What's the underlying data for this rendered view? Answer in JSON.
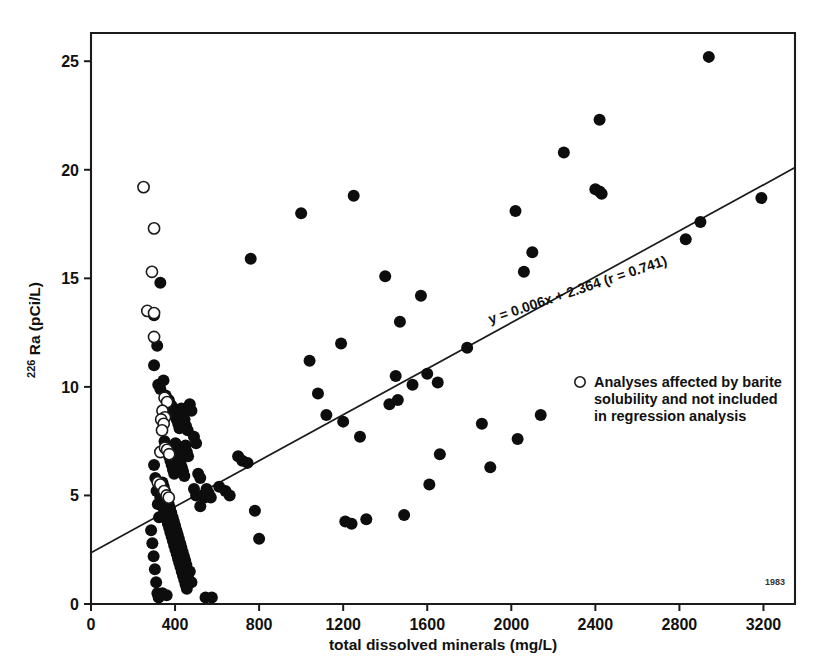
{
  "figure": {
    "stamp": "1983",
    "background_color": "#ffffff",
    "ink_color": "#0d0d0d"
  },
  "chart_data": {
    "type": "scatter",
    "title": "",
    "subtitle": "",
    "xlabel": "total dissolved minerals (mg/L)",
    "ylabel": "226 Ra (pCi/L)",
    "ylabel_superscript": "226",
    "ylabel_main": " Ra (pCi/L)",
    "xlim": [
      0,
      3350
    ],
    "ylim": [
      0,
      26.3
    ],
    "xticks": [
      0,
      400,
      800,
      1200,
      1600,
      2000,
      2400,
      2800,
      3200
    ],
    "xtick_labels": [
      "0",
      "400",
      "800",
      "1200",
      "1600",
      "2000",
      "2400",
      "2800",
      "3200"
    ],
    "yticks": [
      0,
      5,
      10,
      15,
      20,
      25
    ],
    "ytick_labels": [
      "0",
      "5",
      "10",
      "15",
      "20",
      "25"
    ],
    "grid": false,
    "legend_position": "inside-right",
    "annotations": [
      {
        "name": "regression-equation",
        "text": "y = 0.006x + 2.364 (r = 0.741)",
        "rotated": true,
        "angle": -18.5
      },
      {
        "name": "year-stamp",
        "text": "1983"
      }
    ],
    "trendline": {
      "name": "regression-line",
      "equation": "y = 0.006x + 2.364",
      "slope": 0.006,
      "intercept": 2.364,
      "r": 0.741,
      "x_start": 0,
      "y_start": 2.364,
      "x_end": 3350,
      "y_end": 20.1
    },
    "series": [
      {
        "name": "Analyses included in regression",
        "marker": "filled-circle",
        "marker_color": "#0d0d0d",
        "points": [
          [
            300,
            11.0
          ],
          [
            320,
            10.1
          ],
          [
            330,
            9.9
          ],
          [
            345,
            10.3
          ],
          [
            355,
            9.6
          ],
          [
            370,
            9.4
          ],
          [
            378,
            9.2
          ],
          [
            385,
            9.1
          ],
          [
            392,
            8.9
          ],
          [
            400,
            8.7
          ],
          [
            408,
            8.5
          ],
          [
            415,
            8.3
          ],
          [
            421,
            8.1
          ],
          [
            430,
            9.0
          ],
          [
            438,
            8.8
          ],
          [
            445,
            8.5
          ],
          [
            452,
            8.2
          ],
          [
            460,
            8.0
          ],
          [
            470,
            9.2
          ],
          [
            478,
            8.9
          ],
          [
            330,
            14.8
          ],
          [
            300,
            13.3
          ],
          [
            315,
            11.9
          ],
          [
            350,
            7.5
          ],
          [
            358,
            7.2
          ],
          [
            365,
            7.0
          ],
          [
            372,
            6.8
          ],
          [
            378,
            6.6
          ],
          [
            384,
            6.4
          ],
          [
            390,
            6.2
          ],
          [
            396,
            6.0
          ],
          [
            402,
            7.4
          ],
          [
            408,
            7.1
          ],
          [
            414,
            6.9
          ],
          [
            420,
            6.7
          ],
          [
            426,
            6.5
          ],
          [
            432,
            6.3
          ],
          [
            438,
            6.1
          ],
          [
            444,
            5.9
          ],
          [
            450,
            7.3
          ],
          [
            456,
            7.0
          ],
          [
            462,
            6.8
          ],
          [
            340,
            5.6
          ],
          [
            346,
            5.4
          ],
          [
            352,
            5.2
          ],
          [
            358,
            5.0
          ],
          [
            364,
            4.8
          ],
          [
            370,
            4.6
          ],
          [
            376,
            4.4
          ],
          [
            382,
            4.2
          ],
          [
            388,
            4.0
          ],
          [
            394,
            3.8
          ],
          [
            400,
            3.6
          ],
          [
            406,
            3.4
          ],
          [
            412,
            3.2
          ],
          [
            418,
            3.0
          ],
          [
            424,
            2.8
          ],
          [
            430,
            2.6
          ],
          [
            436,
            2.4
          ],
          [
            442,
            2.2
          ],
          [
            448,
            2.0
          ],
          [
            454,
            1.8
          ],
          [
            330,
            4.9
          ],
          [
            336,
            4.7
          ],
          [
            342,
            4.5
          ],
          [
            348,
            4.3
          ],
          [
            354,
            4.1
          ],
          [
            360,
            3.9
          ],
          [
            366,
            3.7
          ],
          [
            372,
            3.5
          ],
          [
            378,
            3.3
          ],
          [
            384,
            3.1
          ],
          [
            390,
            2.9
          ],
          [
            396,
            2.7
          ],
          [
            402,
            2.5
          ],
          [
            408,
            2.3
          ],
          [
            414,
            2.1
          ],
          [
            420,
            1.9
          ],
          [
            426,
            1.7
          ],
          [
            432,
            1.5
          ],
          [
            438,
            1.3
          ],
          [
            444,
            1.1
          ],
          [
            450,
            0.9
          ],
          [
            456,
            0.7
          ],
          [
            462,
            1.2
          ],
          [
            470,
            1.5
          ],
          [
            478,
            1.0
          ],
          [
            300,
            6.4
          ],
          [
            306,
            5.8
          ],
          [
            312,
            5.2
          ],
          [
            318,
            4.6
          ],
          [
            324,
            4.0
          ],
          [
            286,
            3.4
          ],
          [
            292,
            2.8
          ],
          [
            298,
            2.2
          ],
          [
            304,
            1.6
          ],
          [
            310,
            1.0
          ],
          [
            316,
            0.5
          ],
          [
            322,
            0.3
          ],
          [
            340,
            0.5
          ],
          [
            360,
            0.4
          ],
          [
            490,
            7.7
          ],
          [
            500,
            7.4
          ],
          [
            510,
            6.0
          ],
          [
            520,
            5.8
          ],
          [
            530,
            5.0
          ],
          [
            540,
            4.9
          ],
          [
            550,
            5.3
          ],
          [
            560,
            5.1
          ],
          [
            570,
            4.9
          ],
          [
            490,
            5.3
          ],
          [
            500,
            5.0
          ],
          [
            520,
            4.5
          ],
          [
            545,
            0.3
          ],
          [
            575,
            0.3
          ],
          [
            610,
            5.4
          ],
          [
            640,
            5.2
          ],
          [
            660,
            5.0
          ],
          [
            700,
            6.8
          ],
          [
            720,
            6.6
          ],
          [
            745,
            6.5
          ],
          [
            760,
            15.9
          ],
          [
            780,
            4.3
          ],
          [
            800,
            3.0
          ],
          [
            1000,
            18.0
          ],
          [
            1040,
            11.2
          ],
          [
            1080,
            9.7
          ],
          [
            1120,
            8.7
          ],
          [
            1190,
            12.0
          ],
          [
            1200,
            8.4
          ],
          [
            1210,
            3.8
          ],
          [
            1240,
            3.7
          ],
          [
            1250,
            18.8
          ],
          [
            1280,
            7.7
          ],
          [
            1310,
            3.9
          ],
          [
            1400,
            15.1
          ],
          [
            1420,
            9.2
          ],
          [
            1450,
            10.5
          ],
          [
            1460,
            9.4
          ],
          [
            1470,
            13.0
          ],
          [
            1490,
            4.1
          ],
          [
            1530,
            10.1
          ],
          [
            1570,
            14.2
          ],
          [
            1600,
            10.6
          ],
          [
            1610,
            5.5
          ],
          [
            1650,
            10.2
          ],
          [
            1660,
            6.9
          ],
          [
            1790,
            11.8
          ],
          [
            1860,
            8.3
          ],
          [
            1900,
            6.3
          ],
          [
            2020,
            18.1
          ],
          [
            2030,
            7.6
          ],
          [
            2060,
            15.3
          ],
          [
            2100,
            16.2
          ],
          [
            2140,
            8.7
          ],
          [
            2250,
            20.8
          ],
          [
            2400,
            19.1
          ],
          [
            2420,
            19.0
          ],
          [
            2430,
            18.9
          ],
          [
            2420,
            22.3
          ],
          [
            2830,
            16.8
          ],
          [
            2900,
            17.6
          ],
          [
            2940,
            25.2
          ],
          [
            3190,
            18.7
          ]
        ]
      },
      {
        "name": "Analyses affected by barite solubility and not included in regression analysis",
        "marker": "open-circle",
        "marker_color": "#ffffff",
        "points": [
          [
            250,
            19.2
          ],
          [
            300,
            17.3
          ],
          [
            290,
            15.3
          ],
          [
            268,
            13.5
          ],
          [
            300,
            13.4
          ],
          [
            300,
            12.3
          ],
          [
            350,
            9.5
          ],
          [
            362,
            9.3
          ],
          [
            340,
            8.9
          ],
          [
            352,
            8.6
          ],
          [
            334,
            8.5
          ],
          [
            346,
            8.3
          ],
          [
            338,
            8.0
          ],
          [
            330,
            7.0
          ],
          [
            352,
            7.2
          ],
          [
            362,
            7.1
          ],
          [
            372,
            6.9
          ],
          [
            318,
            5.6
          ],
          [
            330,
            5.5
          ],
          [
            348,
            5.2
          ],
          [
            360,
            5.0
          ],
          [
            370,
            4.9
          ]
        ]
      }
    ],
    "legend": {
      "marker": "open-circle",
      "lines": [
        "Analyses affected by barite",
        "solubility and not included",
        "in regression analysis"
      ]
    }
  }
}
